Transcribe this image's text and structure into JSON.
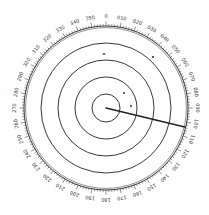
{
  "radar": {
    "center": {
      "x": 106,
      "y": 108
    },
    "scale_radius": 82,
    "range_rings": [
      14,
      31,
      48,
      65
    ],
    "bearing_labels": [
      "0",
      "010",
      "020",
      "030",
      "040",
      "050",
      "060",
      "070",
      "080",
      "090",
      "100",
      "110",
      "120",
      "130",
      "140",
      "150",
      "160",
      "170",
      "180",
      "190",
      "200",
      "210",
      "220",
      "230",
      "240",
      "250",
      "260",
      "270",
      "280",
      "290",
      "300",
      "310",
      "320",
      "330",
      "340",
      "350"
    ],
    "ebl": {
      "bearing_deg": 103.5,
      "length": 81
    },
    "targets": [
      {
        "x": 104,
        "y": 54,
        "w": 3,
        "h": 1.5
      },
      {
        "x": 153,
        "y": 57,
        "w": 2,
        "h": 2
      },
      {
        "x": 124,
        "y": 93,
        "w": 1.8,
        "h": 2
      },
      {
        "x": 131,
        "y": 106,
        "w": 1.5,
        "h": 2.5
      }
    ],
    "colors": {
      "line": "#222222",
      "background": "#ffffff",
      "label": "#333333"
    }
  }
}
